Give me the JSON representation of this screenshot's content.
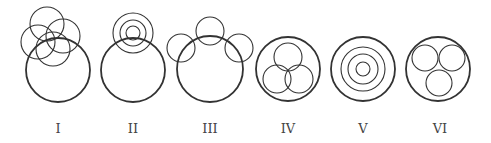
{
  "stroke_color": "#333333",
  "figures": [
    {
      "label": "I",
      "label_x": 58,
      "circles": [
        {
          "cx": 58,
          "cy": 70,
          "r": 32,
          "w": 1.8
        },
        {
          "cx": 47,
          "cy": 24,
          "r": 17,
          "w": 1.1
        },
        {
          "cx": 63,
          "cy": 36,
          "r": 17,
          "w": 1.1
        },
        {
          "cx": 38,
          "cy": 42,
          "r": 17,
          "w": 1.1
        },
        {
          "cx": 53,
          "cy": 49,
          "r": 17,
          "w": 1.1
        }
      ]
    },
    {
      "label": "II",
      "label_x": 133,
      "circles": [
        {
          "cx": 133,
          "cy": 70,
          "r": 32,
          "w": 1.8
        },
        {
          "cx": 133,
          "cy": 33,
          "r": 20,
          "w": 1.1
        },
        {
          "cx": 133,
          "cy": 33,
          "r": 13,
          "w": 1.1
        },
        {
          "cx": 133,
          "cy": 33,
          "r": 7,
          "w": 1.1
        }
      ]
    },
    {
      "label": "III",
      "label_x": 210,
      "circles": [
        {
          "cx": 210,
          "cy": 69,
          "r": 33,
          "w": 1.8
        },
        {
          "cx": 210,
          "cy": 31,
          "r": 14,
          "w": 1.1
        },
        {
          "cx": 181,
          "cy": 48,
          "r": 14,
          "w": 1.1
        },
        {
          "cx": 239,
          "cy": 48,
          "r": 14,
          "w": 1.1
        }
      ]
    },
    {
      "label": "IV",
      "label_x": 288,
      "circles": [
        {
          "cx": 288,
          "cy": 69,
          "r": 32,
          "w": 1.8
        },
        {
          "cx": 288,
          "cy": 57,
          "r": 14,
          "w": 1.1
        },
        {
          "cx": 277,
          "cy": 79,
          "r": 14,
          "w": 1.1
        },
        {
          "cx": 299,
          "cy": 79,
          "r": 14,
          "w": 1.1
        }
      ]
    },
    {
      "label": "V",
      "label_x": 363,
      "circles": [
        {
          "cx": 363,
          "cy": 69,
          "r": 32,
          "w": 1.8
        },
        {
          "cx": 363,
          "cy": 69,
          "r": 22,
          "w": 1.1
        },
        {
          "cx": 363,
          "cy": 69,
          "r": 15,
          "w": 1.1
        },
        {
          "cx": 363,
          "cy": 69,
          "r": 7,
          "w": 1.1
        }
      ]
    },
    {
      "label": "VI",
      "label_x": 440,
      "circles": [
        {
          "cx": 438,
          "cy": 69,
          "r": 32,
          "w": 1.8
        },
        {
          "cx": 425,
          "cy": 58,
          "r": 13,
          "w": 1.1
        },
        {
          "cx": 452,
          "cy": 58,
          "r": 13,
          "w": 1.1
        },
        {
          "cx": 439,
          "cy": 83,
          "r": 13,
          "w": 1.1
        }
      ]
    }
  ],
  "label_y": 133
}
